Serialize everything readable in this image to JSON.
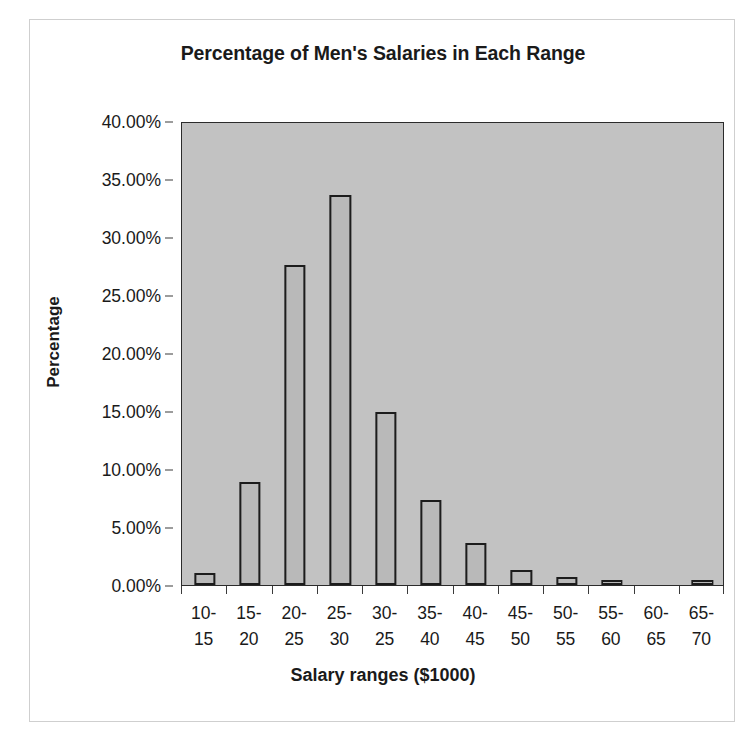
{
  "figure": {
    "title": "Percentage of Men's Salaries in Each Range",
    "plot_bg_color": "#c2c2c2",
    "bar_fill_color": "#b9b9b9",
    "bar_border_color": "#1c1c1c",
    "axis_color": "#2b2b2b",
    "frame_color": "#cfcfcf"
  },
  "chart_data": {
    "type": "bar",
    "title": "Percentage of Men's Salaries in Each Range",
    "xlabel": "Salary ranges ($1000)",
    "ylabel": "Percentage",
    "categories": [
      "10-15",
      "15-20",
      "20-25",
      "25-30",
      "30-25",
      "35-40",
      "40-45",
      "45-50",
      "50-55",
      "55-60",
      "60-65",
      "65-70"
    ],
    "category_lines": [
      [
        "10-",
        "15"
      ],
      [
        "15-",
        "20"
      ],
      [
        "20-",
        "25"
      ],
      [
        "25-",
        "30"
      ],
      [
        "30-",
        "25"
      ],
      [
        "35-",
        "40"
      ],
      [
        "40-",
        "45"
      ],
      [
        "45-",
        "50"
      ],
      [
        "50-",
        "55"
      ],
      [
        "55-",
        "60"
      ],
      [
        "60-",
        "65"
      ],
      [
        "65-",
        "70"
      ]
    ],
    "values": [
      1.0,
      8.9,
      27.6,
      33.6,
      14.9,
      7.3,
      3.6,
      1.3,
      0.7,
      0.4,
      0.0,
      0.15
    ],
    "value_labels": [
      "1.00%",
      "8.90%",
      "27.60%",
      "33.60%",
      "14.90%",
      "7.30%",
      "3.60%",
      "1.30%",
      "0.70%",
      "0.40%",
      "0.00%",
      "0.15%"
    ],
    "ylim": [
      0,
      40
    ],
    "ytick_values": [
      0,
      5,
      10,
      15,
      20,
      25,
      30,
      35,
      40
    ],
    "ytick_labels": [
      "0.00%",
      "5.00%",
      "10.00%",
      "15.00%",
      "20.00%",
      "25.00%",
      "30.00%",
      "35.00%",
      "40.00%"
    ],
    "grid": false,
    "legend": false,
    "series": [
      {
        "name": "Percentage of Men's Salaries",
        "values": [
          1.0,
          8.9,
          27.6,
          33.6,
          14.9,
          7.3,
          3.6,
          1.3,
          0.7,
          0.4,
          0.0,
          0.15
        ]
      }
    ]
  }
}
